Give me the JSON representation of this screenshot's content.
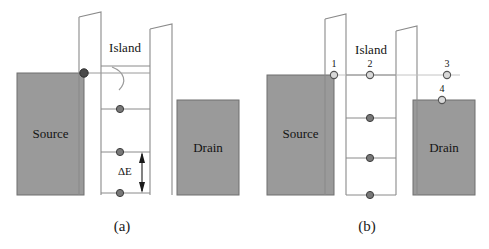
{
  "figure": {
    "type": "energy-band-diagram",
    "panels": [
      {
        "id": "a",
        "caption": "(a)",
        "source_label": "Source",
        "drain_label": "Drain",
        "island_label": "Island",
        "delta_label": "ΔE",
        "has_tunneling_arc": true,
        "level_count": 4,
        "dot_style": "filled",
        "numbered_points": []
      },
      {
        "id": "b",
        "caption": "(b)",
        "source_label": "Source",
        "drain_label": "Drain",
        "island_label": "Island",
        "delta_label": "",
        "has_tunneling_arc": false,
        "level_count": 4,
        "dot_style": "hollow",
        "numbered_points": [
          {
            "id": "1",
            "label": "1",
            "location": "source-edge"
          },
          {
            "id": "2",
            "label": "2",
            "location": "island-top-level"
          },
          {
            "id": "3",
            "label": "3",
            "location": "drain-barrier-right"
          },
          {
            "id": "4",
            "label": "4",
            "location": "drain-top-edge"
          }
        ]
      }
    ]
  },
  "colors": {
    "electrode_fill": "#9a9a9a",
    "electrode_stroke": "#6f6f6f",
    "line": "#8a8a8a",
    "dark_line": "#4a4a4a",
    "dot_fill": "#787878",
    "dot_fill_dark": "#4a4a4a",
    "dot_stroke": "#3d3d3d",
    "hollow_dot_fill": "#d8d8d8",
    "text": "#141414",
    "background": "#ffffff"
  }
}
